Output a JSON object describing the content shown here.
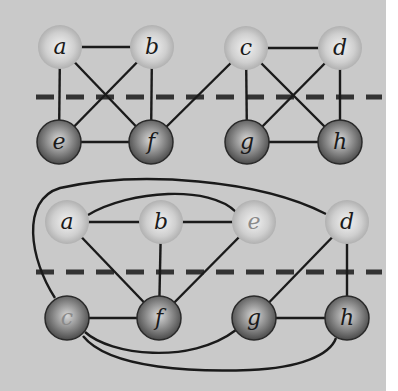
{
  "colors": {
    "background": "#c9c9c9",
    "page": "#ffffff",
    "edge": "#1a1a1a",
    "separator": "#333333",
    "top_node_fill": "#c4c4c4",
    "bottom_node_fill": "#6e6e6e",
    "label_top": "#1a1a1a",
    "label_bottom": "#1a1a1a",
    "label_faint": "#8a8a8a"
  },
  "graphs": [
    {
      "name": "upper-graph",
      "separator_y": 97,
      "nodes": [
        {
          "id": "a",
          "label": "a",
          "x": 60,
          "y": 47,
          "row": "top"
        },
        {
          "id": "b",
          "label": "b",
          "x": 152,
          "y": 47,
          "row": "top"
        },
        {
          "id": "c",
          "label": "c",
          "x": 246,
          "y": 48,
          "row": "top"
        },
        {
          "id": "d",
          "label": "d",
          "x": 340,
          "y": 48,
          "row": "top"
        },
        {
          "id": "e",
          "label": "e",
          "x": 59,
          "y": 142,
          "row": "bottom"
        },
        {
          "id": "f",
          "label": "f",
          "x": 151,
          "y": 142,
          "row": "bottom"
        },
        {
          "id": "g",
          "label": "g",
          "x": 247,
          "y": 142,
          "row": "bottom"
        },
        {
          "id": "h",
          "label": "h",
          "x": 340,
          "y": 142,
          "row": "bottom"
        }
      ],
      "edges": [
        [
          "a",
          "b"
        ],
        [
          "a",
          "e"
        ],
        [
          "a",
          "f"
        ],
        [
          "b",
          "e"
        ],
        [
          "b",
          "f"
        ],
        [
          "e",
          "f"
        ],
        [
          "c",
          "f"
        ],
        [
          "c",
          "d"
        ],
        [
          "c",
          "g"
        ],
        [
          "c",
          "h"
        ],
        [
          "d",
          "g"
        ],
        [
          "d",
          "h"
        ],
        [
          "g",
          "h"
        ]
      ]
    },
    {
      "name": "lower-graph",
      "separator_y": 272,
      "nodes": [
        {
          "id": "a",
          "label": "a",
          "x": 67,
          "y": 222,
          "row": "top"
        },
        {
          "id": "b",
          "label": "b",
          "x": 161,
          "y": 222,
          "row": "top"
        },
        {
          "id": "e",
          "label": "e",
          "x": 254,
          "y": 222,
          "row": "top",
          "faint": true
        },
        {
          "id": "d",
          "label": "d",
          "x": 347,
          "y": 222,
          "row": "top"
        },
        {
          "id": "c",
          "label": "c",
          "x": 67,
          "y": 318,
          "row": "bottom",
          "faint": true
        },
        {
          "id": "f",
          "label": "f",
          "x": 159,
          "y": 318,
          "row": "bottom"
        },
        {
          "id": "g",
          "label": "g",
          "x": 254,
          "y": 318,
          "row": "bottom"
        },
        {
          "id": "h",
          "label": "h",
          "x": 347,
          "y": 318,
          "row": "bottom"
        }
      ],
      "edges": [
        [
          "a",
          "b"
        ],
        [
          "b",
          "e"
        ],
        [
          "a",
          "f"
        ],
        [
          "b",
          "f"
        ],
        [
          "e",
          "f"
        ],
        [
          "c",
          "f"
        ],
        [
          "d",
          "g"
        ],
        [
          "d",
          "h"
        ],
        [
          "g",
          "h"
        ]
      ],
      "curved_edges": [
        {
          "from": "a",
          "to": "e",
          "path": "M 88 215 C 130 190, 210 185, 236 212"
        },
        {
          "from": "c",
          "to": "d",
          "path": "M 55 298 C 30 260, 20 200, 60 188 C 140 170, 260 180, 326 214"
        },
        {
          "from": "c",
          "to": "g",
          "path": "M 85 332 C 110 355, 190 365, 236 330"
        },
        {
          "from": "c",
          "to": "h",
          "path": "M 83 336 C 110 370, 200 372, 250 370 C 300 368, 330 355, 336 338"
        }
      ]
    }
  ]
}
